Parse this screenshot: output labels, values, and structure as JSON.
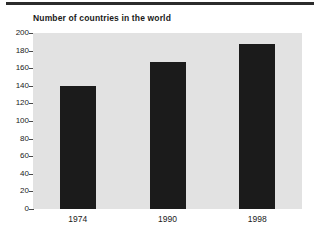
{
  "chart_data": {
    "type": "bar",
    "title": "Number of countries in the world",
    "xlabel": "",
    "ylabel": "",
    "categories": [
      "1974",
      "1990",
      "1998"
    ],
    "values": [
      140,
      167,
      187
    ],
    "series": [
      {
        "name": "Number of countries",
        "values": [
          140,
          167,
          187
        ]
      }
    ],
    "ylim": [
      0,
      200
    ],
    "yticks": [
      0,
      20,
      40,
      60,
      80,
      100,
      120,
      140,
      160,
      180,
      200
    ],
    "ytick_labels": [
      "0",
      "20",
      "40",
      "60",
      "80",
      "100",
      "120",
      "140",
      "160",
      "180",
      "200"
    ],
    "grid": false,
    "legend": null,
    "bar_color": "#1b1b1b",
    "plot_background": "#e2e2e2",
    "page_background": "#ffffff"
  }
}
